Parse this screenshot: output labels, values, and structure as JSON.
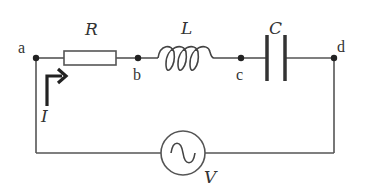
{
  "diagram": {
    "type": "series RLC circuit with AC source",
    "components": {
      "resistor": {
        "label": "R"
      },
      "inductor": {
        "label": "L"
      },
      "capacitor": {
        "label": "C"
      },
      "source": {
        "label": "V",
        "kind": "AC voltage source"
      }
    },
    "nodes": {
      "a": "a",
      "b": "b",
      "c": "c",
      "d": "d"
    },
    "current": {
      "label": "I"
    },
    "colors": {
      "wire": "#555555",
      "ink": "#333333",
      "arrow": "#222222",
      "background": "#ffffff"
    }
  }
}
